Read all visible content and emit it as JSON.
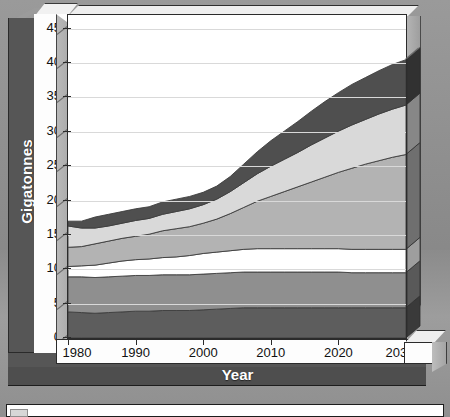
{
  "meta": {
    "accent_dark": "#4a4a4a",
    "frame_border": "#2b2b2b",
    "panel_bg": "#565656",
    "plot_bg": "#ffffff"
  },
  "axes": {
    "y_title": "Gigatonnes",
    "x_title": "Year",
    "y_ticks": [
      "0",
      "5",
      "10",
      "15",
      "20",
      "25",
      "30",
      "35",
      "40",
      "45"
    ],
    "x_ticks": [
      "1980",
      "1990",
      "2000",
      "2010",
      "2020",
      "2030"
    ]
  },
  "chart_data": {
    "type": "area",
    "title": "",
    "subtitle": "",
    "xlabel": "Year",
    "ylabel": "Gigatonnes",
    "xlim": [
      1980,
      2030
    ],
    "ylim": [
      0,
      47
    ],
    "ytick_values": [
      0,
      5,
      10,
      15,
      20,
      25,
      30,
      35,
      40,
      45
    ],
    "xtick_values": [
      1980,
      1990,
      2000,
      2010,
      2020,
      2030
    ],
    "grid": true,
    "grid_axis": "y",
    "legend": "below-plot-clipped",
    "stacked": true,
    "x": [
      1980,
      1982,
      1984,
      1986,
      1988,
      1990,
      1992,
      1994,
      1996,
      1998,
      2000,
      2002,
      2004,
      2006,
      2008,
      2010,
      2012,
      2014,
      2016,
      2018,
      2020,
      2022,
      2024,
      2026,
      2028,
      2030
    ],
    "series": [
      {
        "name": "band-1",
        "color": "#5d5d5d",
        "values": [
          3.8,
          3.7,
          3.6,
          3.7,
          3.8,
          3.9,
          3.9,
          4.0,
          4.0,
          4.0,
          4.1,
          4.2,
          4.3,
          4.4,
          4.4,
          4.4,
          4.4,
          4.4,
          4.4,
          4.4,
          4.4,
          4.4,
          4.4,
          4.4,
          4.4,
          4.4
        ]
      },
      {
        "name": "band-2",
        "color": "#8f8f8f",
        "values": [
          5.1,
          5.2,
          5.2,
          5.2,
          5.2,
          5.2,
          5.2,
          5.2,
          5.2,
          5.2,
          5.2,
          5.2,
          5.2,
          5.2,
          5.2,
          5.2,
          5.2,
          5.2,
          5.2,
          5.2,
          5.2,
          5.1,
          5.1,
          5.1,
          5.1,
          5.1
        ]
      },
      {
        "name": "band-3",
        "color": "#ffffff",
        "values": [
          1.5,
          1.6,
          1.8,
          2.0,
          2.2,
          2.3,
          2.4,
          2.5,
          2.6,
          2.8,
          3.0,
          3.1,
          3.2,
          3.3,
          3.4,
          3.4,
          3.4,
          3.4,
          3.4,
          3.4,
          3.4,
          3.4,
          3.4,
          3.4,
          3.4,
          3.4
        ]
      },
      {
        "name": "band-4",
        "color": "#b3b3b3",
        "values": [
          2.8,
          2.8,
          3.1,
          3.2,
          3.3,
          3.4,
          3.6,
          3.9,
          4.1,
          4.2,
          4.4,
          4.8,
          5.4,
          6.1,
          6.9,
          7.6,
          8.3,
          9.0,
          9.7,
          10.4,
          11.1,
          11.8,
          12.4,
          12.9,
          13.4,
          13.8
        ]
      },
      {
        "name": "band-5",
        "color": "#d9d9d9",
        "values": [
          3.1,
          2.7,
          2.3,
          2.2,
          2.2,
          2.3,
          2.3,
          2.4,
          2.5,
          2.6,
          2.7,
          2.9,
          3.2,
          3.6,
          4.0,
          4.4,
          4.7,
          5.0,
          5.4,
          5.7,
          6.0,
          6.3,
          6.5,
          6.8,
          7.0,
          7.2
        ]
      },
      {
        "name": "band-6",
        "color": "#4f4f4f",
        "values": [
          0.7,
          1.0,
          1.6,
          1.7,
          1.7,
          1.7,
          1.7,
          1.8,
          1.8,
          1.8,
          1.8,
          1.9,
          2.2,
          2.7,
          3.2,
          3.7,
          4.1,
          4.5,
          4.9,
          5.3,
          5.6,
          5.9,
          6.1,
          6.3,
          6.5,
          6.6
        ]
      }
    ],
    "stack_totals": [
      17.0,
      17.0,
      17.6,
      18.0,
      18.4,
      18.8,
      19.1,
      19.8,
      20.2,
      20.6,
      21.2,
      22.1,
      23.5,
      25.3,
      27.1,
      28.7,
      30.1,
      31.5,
      33.0,
      34.4,
      35.7,
      36.9,
      37.9,
      38.9,
      39.8,
      40.5
    ]
  }
}
